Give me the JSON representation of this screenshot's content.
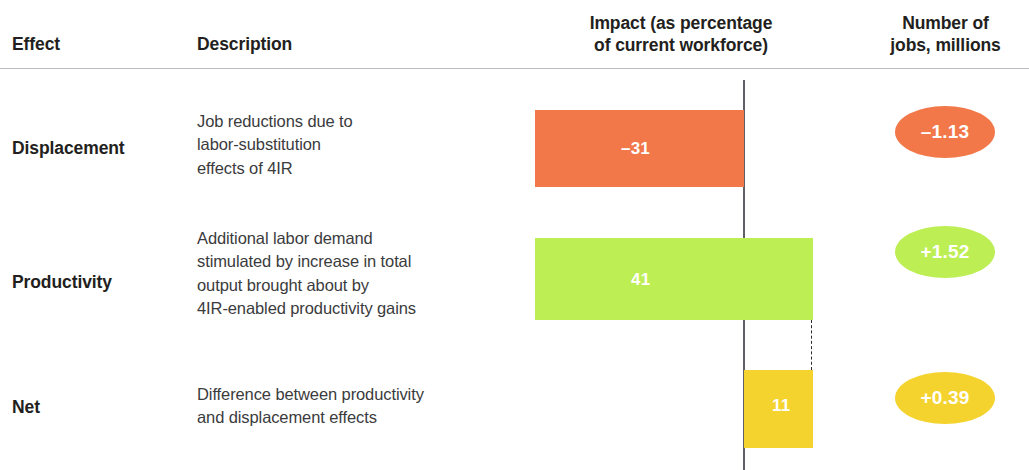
{
  "header": {
    "effect": "Effect",
    "description": "Description",
    "impact_line1": "Impact (as percentage",
    "impact_line2": "of current workforce)",
    "number_line1": "Number of",
    "number_line2": "jobs, millions"
  },
  "rows": [
    {
      "effect": "Displacement",
      "desc_line1": "Job reductions due to",
      "desc_line2": "labor-substitution",
      "desc_line3": "effects of 4IR",
      "bar_label": "–31",
      "badge_label": "–1.13"
    },
    {
      "effect": "Productivity",
      "desc_line1": "Additional labor demand",
      "desc_line2": "stimulated by increase in total",
      "desc_line3": "output brought about by",
      "desc_line4": "4IR-enabled productivity gains",
      "bar_label": "41",
      "badge_label": "+1.52"
    },
    {
      "effect": "Net",
      "desc_line1": "Difference between productivity",
      "desc_line2": "and displacement effects",
      "bar_label": "11",
      "badge_label": "+0.39"
    }
  ],
  "colors": {
    "displacement": "#f27749",
    "productivity": "#bdee53",
    "net": "#f5d32e",
    "axis": "#5d6166",
    "rule": "#b9bcc0",
    "text": "#231f20"
  },
  "chart_data": {
    "type": "bar",
    "title": "Impact (as percentage of current workforce)",
    "orientation": "horizontal",
    "categories": [
      "Displacement",
      "Productivity",
      "Net"
    ],
    "series": [
      {
        "name": "Impact (as percentage of current workforce)",
        "values": [
          -31,
          41,
          11
        ],
        "unit": "percent of current workforce",
        "colors": [
          "#f27749",
          "#bdee53",
          "#f5d32e"
        ]
      },
      {
        "name": "Number of jobs, millions",
        "values": [
          -1.13,
          1.52,
          0.39
        ],
        "unit": "millions of jobs",
        "display": "ellipse-badge"
      }
    ],
    "xlabel": "",
    "ylabel": "",
    "xlim": [
      -31,
      41
    ],
    "zero_axis": true,
    "grid": false,
    "legend": false,
    "annotations": [
      "Dashed connector from end of Productivity bar down to end of Net bar"
    ]
  }
}
